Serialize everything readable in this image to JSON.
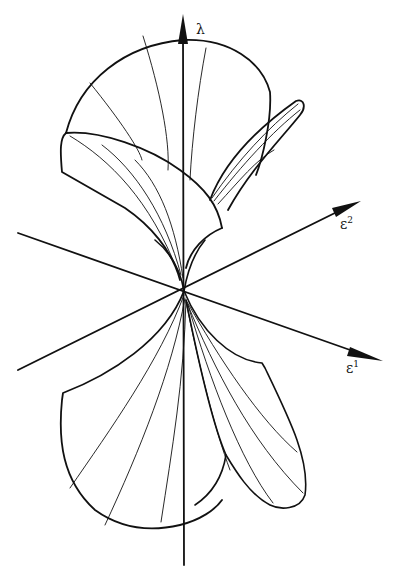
{
  "diagram": {
    "type": "3d-surface-sketch",
    "colors": {
      "stroke": "#111111",
      "background": "#ffffff"
    },
    "axes": [
      {
        "id": "lambda",
        "label": "λ",
        "superscript": ""
      },
      {
        "id": "epsilon2",
        "label": "ε",
        "superscript": "2"
      },
      {
        "id": "epsilon1",
        "label": "ε",
        "superscript": "1"
      }
    ],
    "origin": [
      184,
      291
    ]
  }
}
